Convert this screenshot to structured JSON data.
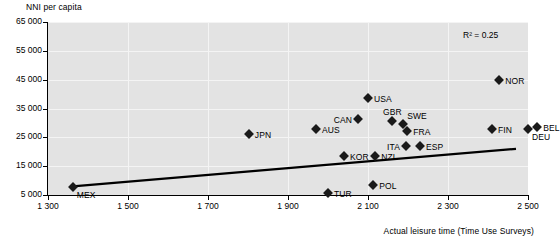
{
  "chart_data": {
    "type": "scatter",
    "title": "",
    "ylabel": "NNI per capita",
    "xlabel": "Actual leisure time (Time Use Surveys)",
    "xlim": [
      1300,
      2500
    ],
    "ylim": [
      5000,
      65000
    ],
    "xticks": [
      "1 300",
      "1 500",
      "1 700",
      "1 900",
      "2 100",
      "2 300",
      "2 500"
    ],
    "xtick_values": [
      1300,
      1500,
      1700,
      1900,
      2100,
      2300,
      2500
    ],
    "yticks": [
      "5 000",
      "15 000",
      "25 000",
      "35 000",
      "45 000",
      "55 000",
      "65 000"
    ],
    "ytick_values": [
      5000,
      15000,
      25000,
      35000,
      45000,
      55000,
      65000
    ],
    "grid": "horizontal-and-vertical",
    "annotation": "R² = 0.25",
    "r_squared": 0.25,
    "legend": "none",
    "trendline": {
      "type": "linear",
      "x_start": 1362,
      "y_start": 8000,
      "x_end": 2470,
      "y_end": 21000
    },
    "points": [
      {
        "label": "MEX",
        "x": 1362,
        "y": 7800,
        "label_pos": "below-right"
      },
      {
        "label": "JPN",
        "x": 1802,
        "y": 26000,
        "label_pos": "right"
      },
      {
        "label": "TUR",
        "x": 2000,
        "y": 5700,
        "label_pos": "right"
      },
      {
        "label": "KOR",
        "x": 2040,
        "y": 18500,
        "label_pos": "right"
      },
      {
        "label": "AUS",
        "x": 1970,
        "y": 28000,
        "label_pos": "right"
      },
      {
        "label": "CAN",
        "x": 2075,
        "y": 31500,
        "label_pos": "left"
      },
      {
        "label": "USA",
        "x": 2100,
        "y": 38800,
        "label_pos": "right"
      },
      {
        "label": "POL",
        "x": 2113,
        "y": 8500,
        "label_pos": "right"
      },
      {
        "label": "NZL",
        "x": 2118,
        "y": 18500,
        "label_pos": "right"
      },
      {
        "label": "GBR",
        "x": 2160,
        "y": 30500,
        "label_pos": "above"
      },
      {
        "label": "SWE",
        "x": 2188,
        "y": 29500,
        "label_pos": "above-right"
      },
      {
        "label": "FRA",
        "x": 2198,
        "y": 27200,
        "label_pos": "right"
      },
      {
        "label": "ITA",
        "x": 2195,
        "y": 22000,
        "label_pos": "left"
      },
      {
        "label": "ESP",
        "x": 2230,
        "y": 22000,
        "label_pos": "right"
      },
      {
        "label": "FIN",
        "x": 2410,
        "y": 27800,
        "label_pos": "right"
      },
      {
        "label": "NOR",
        "x": 2428,
        "y": 45000,
        "label_pos": "right"
      },
      {
        "label": "DEU",
        "x": 2500,
        "y": 27800,
        "label_pos": "below-right"
      },
      {
        "label": "BEL",
        "x": 2523,
        "y": 28500,
        "label_pos": "right"
      }
    ],
    "colors": {
      "plot_background": "#e3e3e3",
      "gridlines": "#f4f4f4",
      "axis": "#000000",
      "marker": "#1a1a1a",
      "trendline": "#000000",
      "page_background": "#ffffff"
    }
  }
}
